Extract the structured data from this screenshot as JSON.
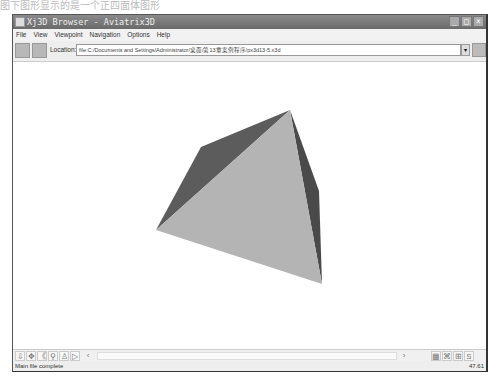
{
  "caption": "图下图形显示的是一个正四面体图形",
  "window": {
    "title": "Xj3D Browser - Aviatrix3D",
    "controls": [
      "minimize",
      "maximize",
      "close"
    ]
  },
  "menu": [
    "File",
    "View",
    "Viewpoint",
    "Navigation",
    "Options",
    "Help"
  ],
  "toolbar": {
    "location_label": "Location:",
    "location_value": "file:C:/Documents and Settings/Administrator/桌面/第13章案例程序/px3d13-5.x3d",
    "dropdown_glyph": "▾"
  },
  "scene": {
    "shape": "tetrahedron",
    "colors": {
      "light_face": "#b4b4b4",
      "dark_face": "#5c5c5c",
      "right_face": "#4a4a4a"
    },
    "faces": [
      {
        "name": "back-left-face",
        "points": "289,109 200,146 155,229",
        "fill": "#5c5c5c"
      },
      {
        "name": "right-face",
        "points": "289,109 318,190 321,283",
        "fill": "#4a4a4a"
      },
      {
        "name": "front-face",
        "points": "289,109 155,229 321,283",
        "fill": "#b4b4b4"
      }
    ]
  },
  "navbar": {
    "left_icons": [
      "examine-icon",
      "pan-icon",
      "tilt-icon",
      "walk-icon",
      "fly-icon",
      "play-icon"
    ],
    "left_glyphs": [
      "⇩",
      "✥",
      "《",
      "⚲",
      "♙",
      "▷"
    ],
    "scroll_left": "‹",
    "scroll_right": "›",
    "right_icons": [
      "fit-icon",
      "binoculars-icon",
      "grid-icon",
      "screenshot-icon"
    ],
    "right_glyphs": [
      "▦",
      "⌘",
      "⊞",
      "S"
    ]
  },
  "status": {
    "message": "Main file complete",
    "fps": "47.61"
  }
}
